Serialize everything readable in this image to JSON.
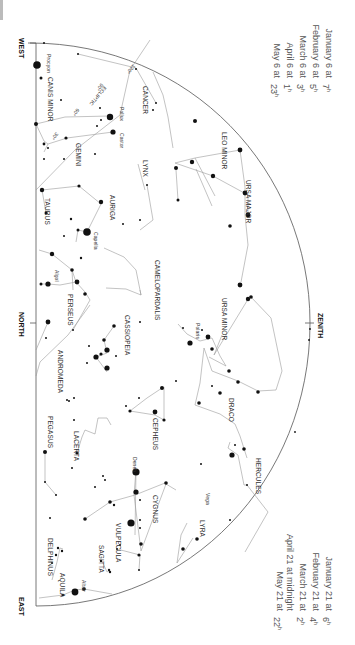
{
  "directions": {
    "west": "WEST",
    "north": "NORTH",
    "east": "EAST",
    "zenith": "ZENITH"
  },
  "ecliptic": {
    "label": "ECLIPTIC",
    "marks": [
      "120°",
      "90°",
      "60°",
      "30°"
    ]
  },
  "times_top": [
    {
      "date": "January 6 at",
      "time": "7",
      "unit": "h"
    },
    {
      "date": "February 6 at",
      "time": "5",
      "unit": "h"
    },
    {
      "date": "March 6 at",
      "time": "3",
      "unit": "h"
    },
    {
      "date": "April 6 at",
      "time": "1",
      "unit": "h"
    },
    {
      "date": "May 6 at",
      "time": "23",
      "unit": "h"
    }
  ],
  "times_bottom": [
    {
      "date": "January 21 at",
      "time": "6",
      "unit": "h"
    },
    {
      "date": "February 21 at",
      "time": "4",
      "unit": "h"
    },
    {
      "date": "March 21 at",
      "time": "2",
      "unit": "h"
    },
    {
      "date": "April 21 at midnight",
      "time": "",
      "unit": ""
    },
    {
      "date": "May 21 at",
      "time": "22",
      "unit": "h"
    }
  ],
  "constellations": {
    "canis_minor": "CANIS MINOR",
    "cancer": "CANCER",
    "gemini": "GEMINI",
    "lynx": "LYNX",
    "leo_minor": "LEO MINOR",
    "ursa_major": "URSA MAJOR",
    "auriga": "AURIGA",
    "taurus": "TAURUS",
    "camelopardalis": "CAMELOPARDALIS",
    "ursa_minor": "URSA MINOR",
    "perseus": "PERSEUS",
    "cassiopeia": "CASSIOPEIA",
    "draco": "DRACO",
    "andromeda": "ANDROMEDA",
    "cepheus": "CEPHEUS",
    "lacerta": "LACERTA",
    "pegasus": "PEGASUS",
    "hercules": "HERCULES",
    "cygnus": "CYGNUS",
    "lyra": "LYRA",
    "vulpecula": "VULPECULA",
    "sagitta": "SAGITTA",
    "delphinus": "DELPHINUS",
    "aquila": "AQUILA"
  },
  "stars": {
    "procyon": "Procyon",
    "pollux": "Pollux",
    "castor": "Castor",
    "capella": "Capella",
    "algol": "Algol",
    "polaris": "Polaris",
    "deneb": "Deneb",
    "vega": "Vega",
    "altair": "Altair"
  },
  "colors": {
    "line": "#9a9a9a",
    "star": "#111111",
    "horizon": "#555555"
  }
}
